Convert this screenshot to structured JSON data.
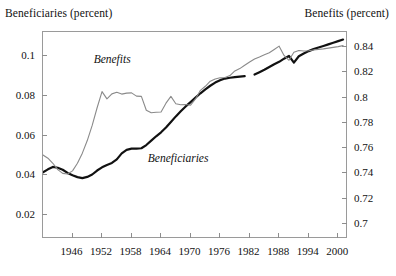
{
  "figure": {
    "left_axis_title": "Beneficiaries  (percent)",
    "right_axis_title": "Benefits  (percent)"
  },
  "annotations": {
    "benefits_label": "Benefits",
    "beneficiaries_label": "Beneficiaries"
  },
  "chart_data": {
    "type": "line",
    "title": "",
    "subtitle": "",
    "xlabel": "",
    "ylabel": "Beneficiaries (percent)",
    "y2label": "Benefits (percent)",
    "grid": false,
    "legend": "inline-annotations",
    "xlim": [
      1940,
      2002
    ],
    "xticks": [
      1946,
      1952,
      1958,
      1964,
      1970,
      1976,
      1982,
      1988,
      1994,
      2000
    ],
    "xticklabels": [
      "1946",
      "1952",
      "1958",
      "1964",
      "1970",
      "1976",
      "1982",
      "1988",
      "1994",
      "2000"
    ],
    "ylim": [
      0.008,
      0.112
    ],
    "yticks": [
      0.02,
      0.04,
      0.06,
      0.08,
      0.1
    ],
    "yticklabels": [
      "0.02",
      "0.04",
      "0.06",
      "0.08",
      "0.1"
    ],
    "y2lim": [
      0.688,
      0.852
    ],
    "y2ticks": [
      0.7,
      0.72,
      0.74,
      0.76,
      0.78,
      0.8,
      0.82,
      0.84
    ],
    "y2ticklabels": [
      "0.7",
      "0.72",
      "0.74",
      "0.76",
      "0.78",
      "0.8",
      "0.82",
      "0.84"
    ],
    "series": [
      {
        "name": "Beneficiaries",
        "axis": "left",
        "color": "#111111",
        "width": 2.2,
        "label_position": {
          "x": 1961.5,
          "y": 0.0512
        },
        "segments": [
          {
            "x": [
              1940,
              1941,
              1942,
              1943,
              1944,
              1945,
              1946,
              1947,
              1948,
              1949,
              1950,
              1951,
              1952,
              1953,
              1954,
              1955,
              1956,
              1957,
              1958,
              1959,
              1960,
              1961,
              1962,
              1963,
              1964,
              1965,
              1966,
              1967,
              1968,
              1969,
              1970,
              1971,
              1972,
              1973,
              1974,
              1975,
              1976,
              1977,
              1978,
              1979,
              1980,
              1981
            ],
            "y": [
              0.0415,
              0.043,
              0.0442,
              0.0438,
              0.0428,
              0.0412,
              0.04,
              0.0391,
              0.0386,
              0.0392,
              0.0404,
              0.0424,
              0.044,
              0.0452,
              0.0462,
              0.048,
              0.051,
              0.0528,
              0.0534,
              0.0534,
              0.0536,
              0.0552,
              0.0574,
              0.0596,
              0.0616,
              0.064,
              0.0668,
              0.0696,
              0.0722,
              0.0746,
              0.0768,
              0.079,
              0.0812,
              0.0832,
              0.085,
              0.0866,
              0.0878,
              0.0886,
              0.089,
              0.0893,
              0.0896,
              0.0898
            ]
          },
          {
            "x": [
              1983,
              1984,
              1985,
              1986,
              1987,
              1988,
              1989,
              1990,
              1991,
              1992,
              1993,
              1994,
              1995,
              1996,
              1997,
              1998,
              1999,
              2000,
              2001
            ],
            "y": [
              0.0906,
              0.0918,
              0.093,
              0.0944,
              0.0958,
              0.097,
              0.0986,
              0.1,
              0.0966,
              0.0998,
              0.1012,
              0.1024,
              0.1034,
              0.1042,
              0.105,
              0.1058,
              0.1066,
              0.1074,
              0.1082
            ]
          }
        ]
      },
      {
        "name": "Benefits",
        "axis": "right",
        "color": "#8a8a8a",
        "width": 1.1,
        "label_position": {
          "x": 1950.5,
          "y": 0.8345
        },
        "segments": [
          {
            "x": [
              1940,
              1941,
              1942,
              1943,
              1944,
              1945,
              1946,
              1947,
              1948,
              1949,
              1950,
              1951,
              1952,
              1953,
              1954,
              1955,
              1956,
              1957,
              1958,
              1959,
              1960,
              1961,
              1962,
              1963,
              1964,
              1965,
              1966,
              1967,
              1968,
              1969,
              1970,
              1971,
              1972,
              1973,
              1974,
              1975,
              1976,
              1977,
              1978,
              1979,
              1980,
              1981,
              1982,
              1983,
              1984,
              1985,
              1986,
              1987,
              1988,
              1989,
              1990,
              1991,
              1992,
              1993,
              1994,
              1995,
              1996,
              1997,
              1998,
              1999,
              2000,
              2001
            ],
            "y": [
              0.7545,
              0.752,
              0.748,
              0.743,
              0.74,
              0.7395,
              0.742,
              0.748,
              0.756,
              0.766,
              0.778,
              0.792,
              0.8048,
              0.799,
              0.803,
              0.8042,
              0.8028,
              0.8036,
              0.8038,
              0.8012,
              0.801,
              0.79,
              0.788,
              0.7884,
              0.7886,
              0.7956,
              0.801,
              0.7952,
              0.7944,
              0.7946,
              0.794,
              0.799,
              0.8058,
              0.809,
              0.813,
              0.8148,
              0.8158,
              0.816,
              0.8175,
              0.8212,
              0.823,
              0.8256,
              0.8282,
              0.8306,
              0.8322,
              0.834,
              0.8356,
              0.8382,
              0.8408,
              0.8334,
              0.8296,
              0.836,
              0.8374,
              0.837,
              0.8372,
              0.8378,
              0.8382,
              0.8386,
              0.8392,
              0.8398,
              0.8404,
              0.8412
            ]
          }
        ]
      }
    ]
  }
}
